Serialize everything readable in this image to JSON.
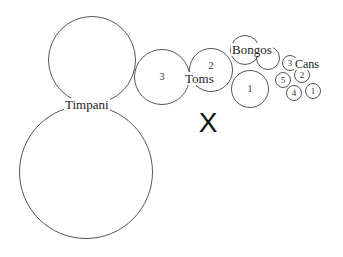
{
  "diagram": {
    "title": "",
    "line_color": "#555555",
    "groups": [
      {
        "name": "Timpani",
        "label": {
          "text": "Timpani",
          "x": 64,
          "y": 98,
          "size": 13
        },
        "drums": [
          {
            "id": "timpani-upper",
            "label": "",
            "cx": 92,
            "cy": 60,
            "r": 44
          },
          {
            "id": "timpani-lower",
            "label": "",
            "cx": 86,
            "cy": 172,
            "r": 67
          }
        ]
      },
      {
        "name": "Toms",
        "label": {
          "text": "Toms",
          "x": 184,
          "y": 72,
          "size": 13
        },
        "drums": [
          {
            "id": "tom-3",
            "label": "3",
            "cx": 162,
            "cy": 77,
            "r": 28,
            "label_size": 10
          },
          {
            "id": "tom-2",
            "label": "2",
            "cx": 211,
            "cy": 70,
            "r": 22,
            "label_size": 10,
            "label_dy": -4
          }
        ]
      },
      {
        "name": "Bongos",
        "label": {
          "text": "Bongos",
          "x": 231,
          "y": 43,
          "size": 13
        },
        "drums": [
          {
            "id": "bongo-top",
            "label": "",
            "cx": 245,
            "cy": 50,
            "r": 15
          },
          {
            "id": "bongo-right",
            "label": "",
            "cx": 268,
            "cy": 58,
            "r": 12
          },
          {
            "id": "bongo-1",
            "label": "1",
            "cx": 250,
            "cy": 89,
            "r": 19,
            "label_size": 10
          }
        ]
      },
      {
        "name": "Cans",
        "label": {
          "text": "Cans",
          "x": 294,
          "y": 58,
          "size": 12
        },
        "drums": [
          {
            "id": "can-3",
            "label": "3",
            "cx": 290,
            "cy": 63,
            "r": 8,
            "label_size": 9
          },
          {
            "id": "can-2",
            "label": "2",
            "cx": 302,
            "cy": 75,
            "r": 8,
            "label_size": 9
          },
          {
            "id": "can-5",
            "label": "5",
            "cx": 283,
            "cy": 80,
            "r": 8,
            "label_size": 9
          },
          {
            "id": "can-4",
            "label": "4",
            "cx": 294,
            "cy": 93,
            "r": 8,
            "label_size": 9
          },
          {
            "id": "can-1",
            "label": "1",
            "cx": 313,
            "cy": 91,
            "r": 8,
            "label_size": 9
          }
        ]
      }
    ],
    "marker": {
      "text": "X",
      "x": 208,
      "y": 123,
      "size": 28,
      "meaning": "conductor-position"
    }
  }
}
